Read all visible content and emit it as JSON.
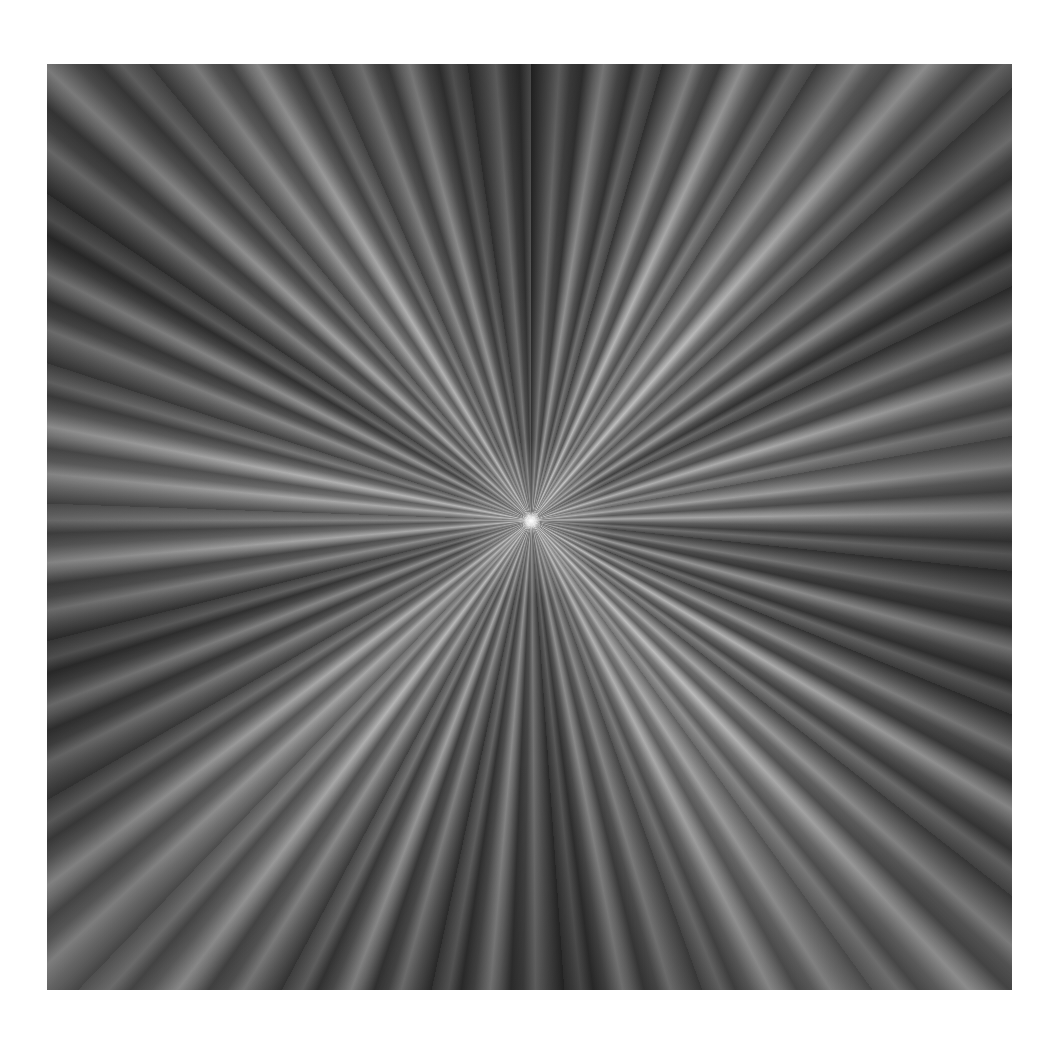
{
  "image": {
    "description": "Abstract grayscale radial light-burst / zoom-blur rays converging on a bright central point",
    "palette": {
      "background": "#ffffff",
      "ray_dark": "#3a3a3a",
      "ray_mid": "#6e6e6e",
      "ray_light": "#b0b0b0",
      "core": "#ffffff"
    },
    "center_point": {
      "x": 531,
      "y": 521
    }
  }
}
